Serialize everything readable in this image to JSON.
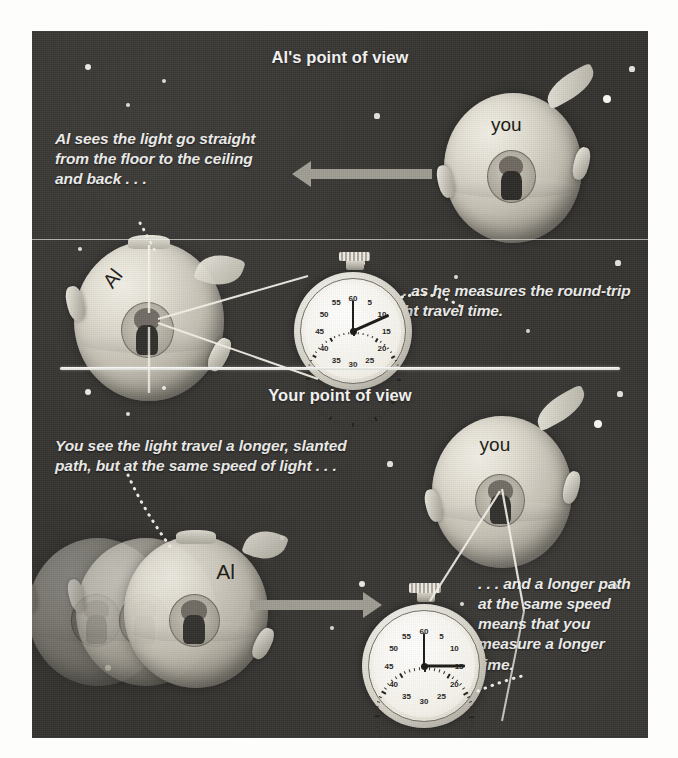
{
  "figure": {
    "title_top": "Al's point of view",
    "title_bottom": "Your point of view",
    "background_color": "#33322f",
    "text_color": "#ececea",
    "accent_color": "#9d9a90"
  },
  "top_panel": {
    "heading": "Al's point of view",
    "caption_left": "Al sees the light go straight from the floor to the ceiling and back . . .",
    "caption_right": ". . . as he measures the round-trip light travel time.",
    "ship_you_label": "you",
    "ship_al_label": "Al",
    "arrow_direction": "left",
    "light_path": "vertical straight up and down"
  },
  "bottom_panel": {
    "heading": "Your point of view",
    "caption_left": "You see the light travel a longer, slanted path, but at the same speed of light . . .",
    "caption_right": ". . . and a longer path at the same speed means that you measure a longer time.",
    "ship_you_label": "you",
    "ship_al_label": "Al",
    "arrow_direction": "right",
    "light_path": "slanted V-shaped longer path"
  },
  "stopwatch_top": {
    "name": "al-stopwatch",
    "numbers": [
      "60",
      "5",
      "10",
      "15",
      "20",
      "25",
      "30",
      "35",
      "40",
      "45",
      "50",
      "55"
    ],
    "reading_seconds": 11,
    "short_hand_seconds": 0
  },
  "stopwatch_bottom": {
    "name": "your-stopwatch",
    "numbers": [
      "60",
      "5",
      "10",
      "15",
      "20",
      "25",
      "30",
      "35",
      "40",
      "45",
      "50",
      "55"
    ],
    "reading_seconds": 15,
    "short_hand_seconds": 0
  },
  "stars": {
    "top": [
      {
        "x": 56,
        "y": 36,
        "r": 3.0
      },
      {
        "x": 132,
        "y": 50,
        "r": 2.2
      },
      {
        "x": 96,
        "y": 74,
        "r": 2.4
      },
      {
        "x": 600,
        "y": 38,
        "r": 2.6
      },
      {
        "x": 575,
        "y": 68,
        "r": 4.0
      },
      {
        "x": 345,
        "y": 85,
        "r": 2.6
      },
      {
        "x": 546,
        "y": 140,
        "r": 2.8
      },
      {
        "x": 48,
        "y": 218,
        "r": 2.4
      },
      {
        "x": 330,
        "y": 232,
        "r": 3.0
      },
      {
        "x": 424,
        "y": 246,
        "r": 2.4
      },
      {
        "x": 586,
        "y": 232,
        "r": 2.6
      },
      {
        "x": 58,
        "y": 320,
        "r": 2.8
      },
      {
        "x": 496,
        "y": 300,
        "r": 2.0
      }
    ],
    "bottom": [
      {
        "x": 56,
        "y": 24,
        "r": 3.0
      },
      {
        "x": 132,
        "y": 20,
        "r": 2.2
      },
      {
        "x": 96,
        "y": 46,
        "r": 2.4
      },
      {
        "x": 588,
        "y": 26,
        "r": 2.6
      },
      {
        "x": 566,
        "y": 56,
        "r": 4.0
      },
      {
        "x": 358,
        "y": 96,
        "r": 2.6
      },
      {
        "x": 540,
        "y": 124,
        "r": 2.8
      },
      {
        "x": 250,
        "y": 170,
        "r": 2.0
      },
      {
        "x": 330,
        "y": 216,
        "r": 3.0
      },
      {
        "x": 430,
        "y": 236,
        "r": 2.4
      },
      {
        "x": 582,
        "y": 218,
        "r": 2.6
      },
      {
        "x": 76,
        "y": 300,
        "r": 2.8
      },
      {
        "x": 300,
        "y": 260,
        "r": 2.0
      }
    ]
  }
}
